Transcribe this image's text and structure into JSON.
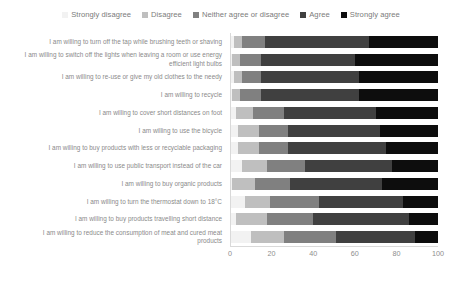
{
  "chart_data": {
    "type": "bar",
    "orientation": "horizontal",
    "stacked": true,
    "stack_mode": "percent",
    "title": "",
    "subtitle": "",
    "xlabel": "",
    "ylabel": "",
    "xlim": [
      0,
      100
    ],
    "xticks": [
      "0",
      "20",
      "40",
      "60",
      "80",
      "100"
    ],
    "xtick_values": [
      0,
      20,
      40,
      60,
      80,
      100
    ],
    "grid": false,
    "legend_position": "top-center",
    "legend": [
      {
        "label": "Strongly disagree",
        "color": "#f2f2f2",
        "swatch_name": "legend-swatch-strongly-disagree"
      },
      {
        "label": "Disagree",
        "color": "#bfbfbf",
        "swatch_name": "legend-swatch-disagree"
      },
      {
        "label": "Neither agree or disagree",
        "color": "#808080",
        "swatch_name": "legend-swatch-neither"
      },
      {
        "label": "Agree",
        "color": "#404040",
        "swatch_name": "legend-swatch-agree"
      },
      {
        "label": "Strongly agree",
        "color": "#0d0d0d",
        "swatch_name": "legend-swatch-strongly-agree"
      }
    ],
    "series": [
      {
        "name": "Strongly disagree",
        "color": "#f2f2f2",
        "values": [
          2,
          1,
          2,
          1,
          3,
          4,
          4,
          6,
          1,
          7,
          3,
          10
        ]
      },
      {
        "name": "Disagree",
        "color": "#bfbfbf",
        "values": [
          4,
          4,
          4,
          4,
          8,
          10,
          10,
          12,
          11,
          12,
          15,
          16
        ]
      },
      {
        "name": "Neither agree or disagree",
        "color": "#808080",
        "values": [
          11,
          10,
          9,
          10,
          15,
          14,
          14,
          18,
          17,
          24,
          22,
          25
        ]
      },
      {
        "name": "Agree",
        "color": "#404040",
        "values": [
          50,
          45,
          47,
          47,
          44,
          44,
          47,
          42,
          44,
          40,
          46,
          38
        ]
      },
      {
        "name": "Strongly agree",
        "color": "#0d0d0d",
        "values": [
          33,
          40,
          38,
          38,
          30,
          28,
          25,
          22,
          27,
          17,
          14,
          11
        ]
      }
    ],
    "categories": [
      "I am willing to turn off the tap while brushing teeth or shaving",
      "I am willing to switch off the lights when leaving a room or use energy efficient light bulbs",
      "I am willing to re-use or give my old clothes to the needy",
      "I am willing to recycle",
      "I am willing to cover short distances on foot",
      "I am willing to use the bicycle",
      "I am willing to buy products with less or recyclable packaging",
      "I am willing to use public transport instead of the car",
      "I am willing to buy organic products",
      "I am willing to turn the thermostat down to 18°C",
      "I am willing to buy products travelling short distance",
      "I am willing to reduce the consumption of meat and cured meat products"
    ]
  }
}
